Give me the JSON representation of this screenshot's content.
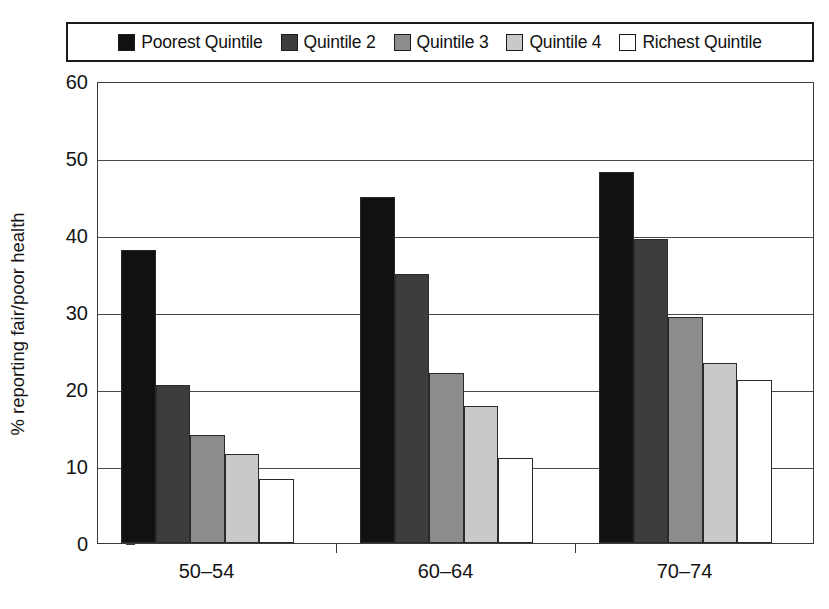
{
  "chart_data": {
    "type": "bar",
    "title": "",
    "subtitle": "",
    "xlabel": "",
    "ylabel": "% reporting fair/poor health",
    "categories": [
      "50–54",
      "60–64",
      "70–74"
    ],
    "series": [
      {
        "name": "Poorest Quintile",
        "color": "#111111",
        "values": [
          38.0,
          45.0,
          48.2
        ]
      },
      {
        "name": "Quintile 2",
        "color": "#3d3d3d",
        "values": [
          20.5,
          35.0,
          39.5
        ]
      },
      {
        "name": "Quintile 3",
        "color": "#8c8c8c",
        "values": [
          14.0,
          22.1,
          29.3
        ]
      },
      {
        "name": "Quintile 4",
        "color": "#c9c9c9",
        "values": [
          11.5,
          17.8,
          23.4
        ]
      },
      {
        "name": "Richest Quintile",
        "color": "#ffffff",
        "values": [
          8.3,
          11.0,
          21.2
        ]
      }
    ],
    "ylim": [
      0,
      60
    ],
    "yticks": [
      0,
      10,
      20,
      30,
      40,
      50,
      60
    ],
    "ytick_labels": [
      "0",
      "10",
      "20",
      "30",
      "40",
      "50",
      "60"
    ],
    "grid": true,
    "grid_axis": "y",
    "legend_position": "top",
    "legend_border": true,
    "frame": true
  },
  "legend": {
    "items": [
      {
        "label": "Poorest Quintile",
        "color": "#111111"
      },
      {
        "label": "Quintile 2",
        "color": "#3d3d3d"
      },
      {
        "label": "Quintile 3",
        "color": "#8c8c8c"
      },
      {
        "label": "Quintile 4",
        "color": "#c9c9c9"
      },
      {
        "label": "Richest Quintile",
        "color": "#ffffff"
      }
    ]
  }
}
